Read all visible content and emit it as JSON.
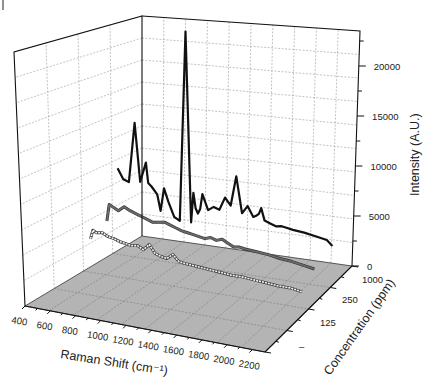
{
  "chart_data": {
    "type": "line",
    "subtype": "3d-waterfall",
    "title": "",
    "xlabel": "Raman Shift (cm⁻¹)",
    "ylabel": "Concentration (ppm)",
    "zlabel": "Intensity (A.U.)",
    "x_ticks": [
      "400",
      "600",
      "800",
      "1000",
      "1200",
      "1400",
      "1600",
      "1800",
      "2000",
      "2200"
    ],
    "y_ticks": [
      "1000",
      "250",
      "125",
      "–"
    ],
    "z_ticks": [
      "0",
      "5000",
      "10000",
      "15000",
      "20000"
    ],
    "xlim": [
      400,
      2300
    ],
    "zlim": [
      0,
      23000
    ],
    "grid": true,
    "floor_color": "#b4b4b4",
    "series": [
      {
        "name": "1000 ppm",
        "color": "#111111",
        "x": [
          350,
          400,
          450,
          500,
          550,
          600,
          620,
          650,
          700,
          730,
          760,
          800,
          850,
          900,
          950,
          1000,
          1020,
          1040,
          1060,
          1080,
          1100,
          1150,
          1200,
          1250,
          1300,
          1350,
          1400,
          1450,
          1500,
          1550,
          1580,
          1600,
          1620,
          1650,
          1700,
          1750,
          1800,
          1850,
          1900,
          2000,
          2100,
          2200,
          2250
        ],
        "values": [
          7800,
          6800,
          6600,
          12600,
          6800,
          8800,
          6800,
          6500,
          5800,
          4200,
          6500,
          5200,
          3800,
          3500,
          22500,
          3500,
          6500,
          5000,
          4500,
          5000,
          6500,
          5000,
          5400,
          5200,
          6500,
          5800,
          8800,
          5200,
          6000,
          5000,
          5200,
          5400,
          6000,
          4800,
          4600,
          4400,
          4500,
          4400,
          4300,
          4200,
          4000,
          3800,
          3300
        ]
      },
      {
        "name": "250 ppm",
        "color": "#6a6a6a",
        "x": [
          400,
          420,
          450,
          500,
          550,
          600,
          650,
          700,
          750,
          800,
          850,
          900,
          950,
          1000,
          1050,
          1100,
          1150,
          1200,
          1250,
          1300,
          1350,
          1400,
          1450,
          1500,
          1550,
          1600,
          1700,
          1800,
          1900,
          2000,
          2100,
          2200
        ],
        "values": [
          3600,
          5300,
          5100,
          4800,
          5300,
          5000,
          4800,
          4600,
          4400,
          4200,
          4300,
          4400,
          4200,
          4000,
          3800,
          3700,
          3600,
          3500,
          3400,
          3600,
          3400,
          3600,
          3300,
          3000,
          3100,
          3000,
          2900,
          2800,
          2600,
          2500,
          2300,
          2100
        ]
      },
      {
        "name": "125 ppm",
        "color": "#f2f2f2",
        "x": [
          400,
          420,
          450,
          500,
          550,
          600,
          650,
          700,
          750,
          800,
          850,
          900,
          950,
          1000,
          1050,
          1100,
          1150,
          1200,
          1300,
          1400,
          1500,
          1600,
          1700,
          1800,
          1900,
          2000,
          2100,
          2200
        ],
        "values": [
          2800,
          3700,
          3500,
          3600,
          3300,
          3200,
          3000,
          2900,
          2800,
          2900,
          2600,
          3200,
          2400,
          2200,
          2100,
          2600,
          2000,
          1900,
          1800,
          1700,
          1600,
          1500,
          1500,
          1400,
          1300,
          1200,
          1200,
          1000
        ]
      }
    ]
  }
}
